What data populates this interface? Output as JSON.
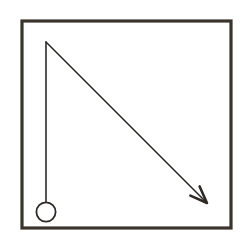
{
  "figure": {
    "kind": "diagram",
    "width": 245,
    "height": 244,
    "background_color": "#ffffff"
  },
  "colors": {
    "background": "#ffffff",
    "frame_stroke": "#3a342c",
    "rod_stroke": "#2e2a26",
    "bob_stroke": "#2e2a26",
    "bob_fill": "#ffffff",
    "arrow_stroke": "#2e2a26"
  },
  "frame": {
    "name": "outer border box",
    "x": 22,
    "y": 21,
    "width": 209,
    "height": 207,
    "stroke_width": 3.2,
    "fill": "none"
  },
  "pivot": {
    "name": "pivot point",
    "x": 46,
    "y": 42
  },
  "rod": {
    "name": "pendulum rod",
    "x1": 46,
    "y1": 42,
    "x2": 46,
    "y2": 202,
    "stroke_width": 1.6,
    "length": 160,
    "orientation": "vertical"
  },
  "bob": {
    "name": "pendulum bob",
    "cx": 46,
    "cy": 212,
    "r": 9.6,
    "stroke_width": 1.8,
    "fill": "none"
  },
  "arrow": {
    "name": "swing direction arrow",
    "x1": 46,
    "y1": 42,
    "x2": 207,
    "y2": 203,
    "stroke_width": 1.6,
    "angle_degrees": 45,
    "direction": "down-right",
    "head": {
      "style": "open-v",
      "length": 17,
      "half_width": 6.5,
      "tip_x": 207,
      "tip_y": 203
    }
  },
  "labels": {
    "frame": "border-frame",
    "rod": "rod-line",
    "bob": "bob-circle",
    "arrow": "direction-arrow",
    "pivot": "pivot-point"
  }
}
